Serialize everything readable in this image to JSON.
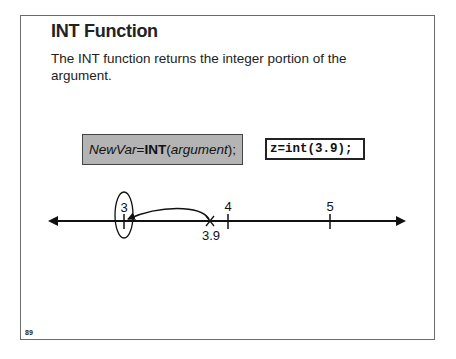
{
  "slide": {
    "title": "INT Function",
    "description": "The INT function returns the integer portion of the argument.",
    "syntax": {
      "var": "NewVar",
      "eq": "=",
      "func": "INT",
      "open": "(",
      "arg": "argument",
      "close": ");"
    },
    "example_code": "z=int(3.9);",
    "number_line": {
      "labels": {
        "tick3": "3",
        "tick4": "4",
        "tick5": "5",
        "point": "3.9"
      }
    },
    "page_number": "89"
  },
  "colors": {
    "syntax_box_bg": "#b4b4b4",
    "border": "#6b6b6b",
    "text": "#222222"
  }
}
